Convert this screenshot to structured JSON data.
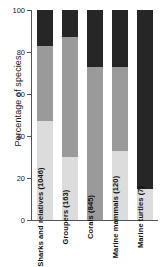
{
  "chart_data": {
    "type": "bar",
    "subtype": "stacked-percentage",
    "title": "",
    "xlabel": "",
    "ylabel": "Percentage of species",
    "ylim": [
      0,
      100
    ],
    "yticks": [
      0,
      20,
      40,
      60,
      80,
      100
    ],
    "ytick_labels": [
      "0",
      "20",
      "40",
      "60",
      "80",
      "100"
    ],
    "grid": false,
    "legend": false,
    "categories": [
      "Sharks and relatives (1046)",
      "Groupers (163)",
      "Corals (845)",
      "Marine mammals (120)",
      "Marine turtles (7)"
    ],
    "series": [
      {
        "name": "light-gray-segment",
        "color": "#dcdcdc",
        "values": [
          47,
          30,
          0,
          33,
          15
        ]
      },
      {
        "name": "mid-gray-segment",
        "color": "#9a9a9a",
        "values": [
          36,
          57,
          73,
          40,
          0
        ]
      },
      {
        "name": "dark-segment",
        "color": "#262626",
        "values": [
          17,
          13,
          27,
          27,
          85
        ]
      }
    ],
    "stack_tops": {
      "light_top": [
        47,
        30,
        0,
        33,
        15
      ],
      "mid_top": [
        83,
        87,
        73,
        73,
        15
      ],
      "dark_top": [
        100,
        100,
        100,
        100,
        100
      ]
    }
  },
  "axis": {
    "y_title": "Percentage of species"
  }
}
